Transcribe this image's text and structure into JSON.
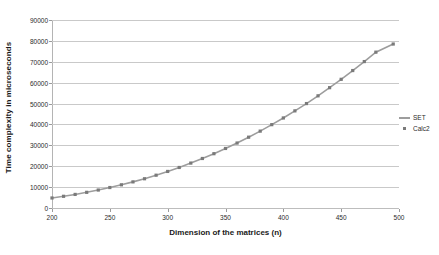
{
  "chart_data": {
    "type": "line",
    "title": "",
    "xlabel": "Dimension of the matrices (n)",
    "ylabel": "Time complexity in microseconds",
    "xlim": [
      200,
      500
    ],
    "ylim": [
      0,
      90000
    ],
    "xticks": [
      200,
      250,
      300,
      350,
      400,
      450,
      500
    ],
    "xtick_labels": [
      "200",
      "250",
      "300",
      "350",
      "400",
      "450",
      "500"
    ],
    "yticks": [
      0,
      10000,
      20000,
      30000,
      40000,
      50000,
      60000,
      70000,
      80000,
      90000
    ],
    "ytick_labels": [
      "0",
      "10000",
      "20000",
      "30000",
      "40000",
      "50000",
      "60000",
      "70000",
      "80000",
      "90000"
    ],
    "grid": "horizontal",
    "legend_position": "right",
    "legend": [
      "SET",
      "Calc2"
    ],
    "series": [
      {
        "name": "SET",
        "style": "line",
        "color": "#9d9d9d",
        "x": [
          200,
          210,
          220,
          230,
          240,
          250,
          260,
          270,
          280,
          290,
          300,
          310,
          320,
          330,
          340,
          350,
          360,
          370,
          380,
          390,
          400,
          410,
          420,
          430,
          440,
          450,
          460,
          470,
          480,
          495
        ],
        "values": [
          4800,
          5600,
          6500,
          7500,
          8600,
          9800,
          11100,
          12500,
          14000,
          15700,
          17500,
          19400,
          21500,
          23700,
          26000,
          28500,
          31100,
          33900,
          36800,
          39900,
          43100,
          46500,
          50000,
          53700,
          57600,
          61600,
          65800,
          70100,
          74600,
          78500
        ]
      },
      {
        "name": "Calc2",
        "style": "marker",
        "color": "#7a7a7a",
        "x": [
          200,
          210,
          220,
          230,
          240,
          250,
          260,
          270,
          280,
          290,
          300,
          310,
          320,
          330,
          340,
          350,
          360,
          370,
          380,
          390,
          400,
          410,
          420,
          430,
          440,
          450,
          460,
          470,
          480,
          495
        ],
        "values": [
          4800,
          5600,
          6500,
          7500,
          8600,
          9800,
          11100,
          12500,
          14000,
          15700,
          17500,
          19400,
          21500,
          23700,
          26000,
          28500,
          31100,
          33900,
          36800,
          39900,
          43100,
          46500,
          50000,
          53700,
          57600,
          61600,
          65800,
          70100,
          74600,
          78500
        ]
      }
    ]
  }
}
